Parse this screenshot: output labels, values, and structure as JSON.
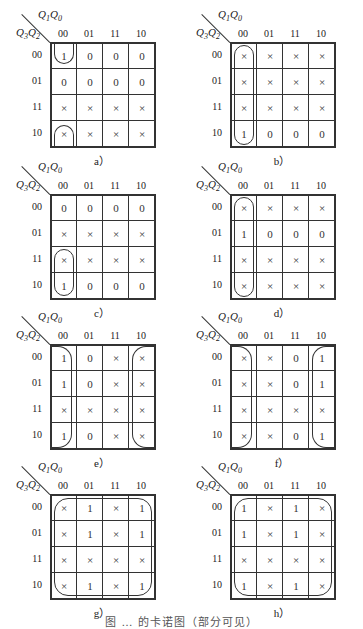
{
  "figure": {
    "caption_partial": "图 … 的卡诺图（部分可见）",
    "axis_top": "Q1Q0",
    "axis_left": "Q3Q2",
    "col_labels": [
      "00",
      "01",
      "11",
      "10"
    ],
    "row_labels": [
      "00",
      "01",
      "11",
      "10"
    ],
    "maps": [
      {
        "id": "a",
        "caption": "a）",
        "cells": [
          [
            "1",
            "0",
            "0",
            "0"
          ],
          [
            "0",
            "0",
            "0",
            "0"
          ],
          [
            "×",
            "×",
            "×",
            "×"
          ],
          [
            "×",
            "×",
            "×",
            "×"
          ]
        ],
        "loops": "col 00 rows 00 & 10 (wrap-around top/bottom)"
      },
      {
        "id": "b",
        "caption": "b）",
        "cells": [
          [
            "×",
            "×",
            "×",
            "×"
          ],
          [
            "×",
            "×",
            "×",
            "×"
          ],
          [
            "×",
            "×",
            "×",
            "×"
          ],
          [
            "1",
            "0",
            "0",
            "0"
          ]
        ],
        "loops": "col 00, all rows"
      },
      {
        "id": "c",
        "caption": "c）",
        "cells": [
          [
            "0",
            "0",
            "0",
            "0"
          ],
          [
            "×",
            "×",
            "×",
            "×"
          ],
          [
            "×",
            "×",
            "×",
            "×"
          ],
          [
            "1",
            "0",
            "0",
            "0"
          ]
        ],
        "loops": "col 00, rows 11 & 10"
      },
      {
        "id": "d",
        "caption": "d）",
        "cells": [
          [
            "×",
            "×",
            "×",
            "×"
          ],
          [
            "1",
            "0",
            "0",
            "0"
          ],
          [
            "×",
            "×",
            "×",
            "×"
          ],
          [
            "×",
            "×",
            "×",
            "×"
          ]
        ],
        "loops": "col 00, all rows"
      },
      {
        "id": "e",
        "caption": "e）",
        "cells": [
          [
            "1",
            "0",
            "×",
            "×"
          ],
          [
            "1",
            "0",
            "×",
            "×"
          ],
          [
            "×",
            "×",
            "×",
            "×"
          ],
          [
            "1",
            "0",
            "×",
            "×"
          ]
        ],
        "loops": "cols 00 & 10 (wrap-around left/right)"
      },
      {
        "id": "f",
        "caption": "f）",
        "cells": [
          [
            "×",
            "×",
            "0",
            "1"
          ],
          [
            "×",
            "×",
            "0",
            "1"
          ],
          [
            "×",
            "×",
            "×",
            "×"
          ],
          [
            "×",
            "×",
            "0",
            "1"
          ]
        ],
        "loops": "cols 00 & 10 (wrap-around left/right)"
      },
      {
        "id": "g",
        "caption": "g）",
        "cells": [
          [
            "×",
            "1",
            "×",
            "1"
          ],
          [
            "×",
            "1",
            "×",
            "1"
          ],
          [
            "×",
            "×",
            "×",
            "×"
          ],
          [
            "×",
            "1",
            "×",
            "1"
          ]
        ],
        "loops": "all 16 cells"
      },
      {
        "id": "h",
        "caption": "h）",
        "cells": [
          [
            "1",
            "×",
            "1",
            "×"
          ],
          [
            "1",
            "×",
            "1",
            "×"
          ],
          [
            "×",
            "×",
            "×",
            "×"
          ],
          [
            "1",
            "×",
            "1",
            "×"
          ]
        ],
        "loops": "all 16 cells"
      }
    ]
  }
}
